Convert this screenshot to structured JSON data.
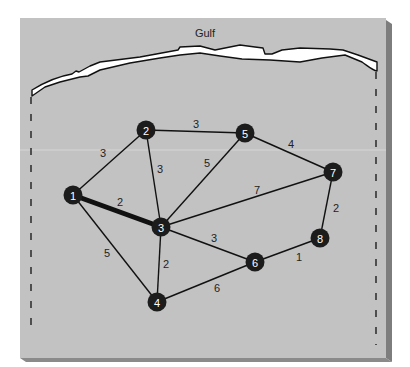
{
  "figure": {
    "title": "Gulf",
    "colors": {
      "page_background": "#ffffff",
      "panel_fill": "#c2c2c2",
      "panel_edge_right": "#7d7d7d",
      "panel_edge_bottom": "#8a8a8a",
      "coast_fill": "#ffffff",
      "coast_stroke": "#111111",
      "node_fill": "#1c1c1c",
      "node_text": "#ffffff",
      "edge_stroke": "#111111",
      "edge_label": "#222222"
    }
  },
  "graph": {
    "nodes": [
      {
        "id": "1",
        "label": "1",
        "x": 73,
        "y": 195
      },
      {
        "id": "2",
        "label": "2",
        "x": 146,
        "y": 130
      },
      {
        "id": "3",
        "label": "3",
        "x": 161,
        "y": 227
      },
      {
        "id": "4",
        "label": "4",
        "x": 157,
        "y": 302
      },
      {
        "id": "5",
        "label": "5",
        "x": 245,
        "y": 133
      },
      {
        "id": "6",
        "label": "6",
        "x": 255,
        "y": 262
      },
      {
        "id": "7",
        "label": "7",
        "x": 333,
        "y": 172
      },
      {
        "id": "8",
        "label": "8",
        "x": 320,
        "y": 238
      }
    ],
    "edges": [
      {
        "from": "1",
        "to": "2",
        "weight": "3",
        "lx": 103,
        "ly": 153,
        "highlighted": false
      },
      {
        "from": "1",
        "to": "3",
        "weight": "2",
        "lx": 120,
        "ly": 202,
        "highlighted": true
      },
      {
        "from": "1",
        "to": "4",
        "weight": "5",
        "lx": 107,
        "ly": 253,
        "highlighted": false
      },
      {
        "from": "2",
        "to": "3",
        "weight": "3",
        "lx": 160,
        "ly": 169,
        "highlighted": false
      },
      {
        "from": "2",
        "to": "5",
        "weight": "3",
        "lx": 196,
        "ly": 124,
        "highlighted": false
      },
      {
        "from": "3",
        "to": "5",
        "weight": "5",
        "lx": 207,
        "ly": 163,
        "highlighted": false
      },
      {
        "from": "3",
        "to": "7",
        "weight": "7",
        "lx": 257,
        "ly": 190,
        "highlighted": false
      },
      {
        "from": "3",
        "to": "6",
        "weight": "3",
        "lx": 214,
        "ly": 238,
        "highlighted": false
      },
      {
        "from": "3",
        "to": "4",
        "weight": "2",
        "lx": 166,
        "ly": 264,
        "highlighted": false
      },
      {
        "from": "4",
        "to": "6",
        "weight": "6",
        "lx": 217,
        "ly": 288,
        "highlighted": false
      },
      {
        "from": "5",
        "to": "7",
        "weight": "4",
        "lx": 291,
        "ly": 144,
        "highlighted": false
      },
      {
        "from": "7",
        "to": "8",
        "weight": "2",
        "lx": 336,
        "ly": 208,
        "highlighted": false
      },
      {
        "from": "6",
        "to": "8",
        "weight": "1",
        "lx": 299,
        "ly": 257,
        "highlighted": false
      }
    ]
  }
}
